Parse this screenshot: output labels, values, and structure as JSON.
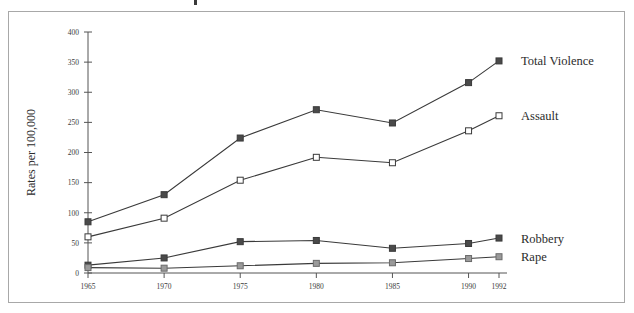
{
  "figure": {
    "yaxis_title": "Rates per 100,000",
    "frame_color": "#a8a8a8",
    "background_color": "#ffffff"
  },
  "chart_data": {
    "type": "line",
    "title": "",
    "xlabel": "",
    "ylabel": "Rates per 100,000",
    "categories": [
      "1965",
      "1970",
      "1975",
      "1980",
      "1985",
      "1990",
      "1992"
    ],
    "x_tick_labels": [
      "1965",
      "1970",
      "1975",
      "1980",
      "1985",
      "1990",
      "1992"
    ],
    "y_tick_labels": [
      "0",
      "50",
      "100",
      "150",
      "200",
      "250",
      "300",
      "350",
      "400"
    ],
    "ylim": [
      0,
      400
    ],
    "ytick_step": 50,
    "grid": false,
    "legend_position": "right-inline",
    "series": [
      {
        "name": "Total Violence",
        "label": "Total Violence",
        "marker": "filled-square",
        "color": "#3a3a3a",
        "marker_fill": "#4a4a4a",
        "values": [
          85,
          130,
          224,
          271,
          249,
          316,
          352
        ]
      },
      {
        "name": "Assault",
        "label": "Assault",
        "marker": "open-square",
        "color": "#3a3a3a",
        "marker_fill": "#ffffff",
        "values": [
          60,
          91,
          154,
          192,
          183,
          236,
          261
        ]
      },
      {
        "name": "Robbery",
        "label": "Robbery",
        "marker": "filled-square",
        "color": "#3a3a3a",
        "marker_fill": "#4a4a4a",
        "values": [
          13,
          25,
          52,
          54,
          41,
          49,
          58
        ]
      },
      {
        "name": "Rape",
        "label": "Rape",
        "marker": "shaded-square",
        "color": "#6a6a6a",
        "marker_fill": "#9a9a9a",
        "values": [
          9,
          8,
          12,
          16,
          17,
          24,
          27
        ]
      }
    ]
  }
}
